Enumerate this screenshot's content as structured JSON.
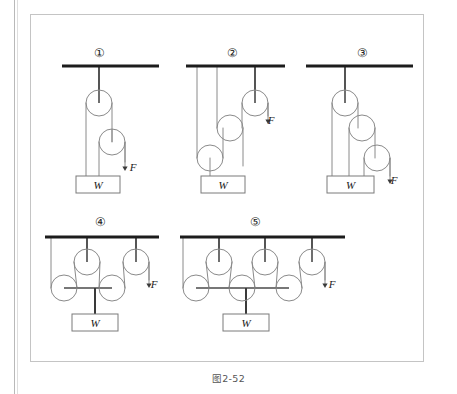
{
  "figure": {
    "caption": "图2-52",
    "background_color": "#ffffff",
    "border_color": "#c4c4c4",
    "line_color": "#6b6b6b",
    "ceiling_color": "#1c1c1c",
    "rope_color": "#8a8a8a",
    "pulley_stroke": "#8a8a8a",
    "text_color": "#222222"
  },
  "diagrams": [
    {
      "id": "diagram-1",
      "label": "①",
      "label_x": 99,
      "label_y": 57,
      "ceiling": {
        "x1": 62,
        "y1": 66,
        "x2": 159,
        "y2": 66
      },
      "effort_label": "F",
      "effort_label_x": 133,
      "effort_label_y": 171,
      "load_label": "W",
      "load_box": {
        "x": 76,
        "y": 176,
        "w": 44,
        "h": 17
      },
      "pulleys": [
        {
          "name": "fixed-pulley-1",
          "cx": 99,
          "cy": 103,
          "r": 13,
          "type": "fixed"
        },
        {
          "name": "movable-pulley-1",
          "cx": 112,
          "cy": 142,
          "r": 13,
          "type": "movable"
        }
      ]
    },
    {
      "id": "diagram-2",
      "label": "②",
      "label_x": 232,
      "label_y": 57,
      "ceiling": {
        "x1": 186,
        "y1": 66,
        "x2": 285,
        "y2": 66
      },
      "effort_label": "F",
      "effort_label_x": 271,
      "effort_label_y": 124,
      "load_label": "W",
      "load_box": {
        "x": 201,
        "y": 176,
        "w": 44,
        "h": 17
      },
      "pulleys": [
        {
          "name": "fixed-pulley-1",
          "cx": 255,
          "cy": 103,
          "r": 13,
          "type": "fixed"
        },
        {
          "name": "movable-pulley-1",
          "cx": 230,
          "cy": 128,
          "r": 13,
          "type": "movable"
        },
        {
          "name": "movable-pulley-2",
          "cx": 210,
          "cy": 158,
          "r": 13,
          "type": "movable"
        }
      ]
    },
    {
      "id": "diagram-3",
      "label": "③",
      "label_x": 362,
      "label_y": 57,
      "ceiling": {
        "x1": 306,
        "y1": 66,
        "x2": 413,
        "y2": 66
      },
      "effort_label": "F",
      "effort_label_x": 394,
      "effort_label_y": 184,
      "load_label": "W",
      "load_box": {
        "x": 327,
        "y": 176,
        "w": 47,
        "h": 17
      },
      "pulleys": [
        {
          "name": "fixed-pulley-1",
          "cx": 345,
          "cy": 103,
          "r": 13,
          "type": "fixed"
        },
        {
          "name": "movable-pulley-1",
          "cx": 362,
          "cy": 128,
          "r": 13,
          "type": "movable"
        },
        {
          "name": "movable-pulley-2",
          "cx": 377,
          "cy": 158,
          "r": 13,
          "type": "movable"
        }
      ]
    },
    {
      "id": "diagram-4",
      "label": "④",
      "label_x": 100,
      "label_y": 226,
      "ceiling": {
        "x1": 45,
        "y1": 237,
        "x2": 159,
        "y2": 237
      },
      "effort_label": "F",
      "effort_label_x": 154,
      "effort_label_y": 288,
      "load_label": "W",
      "load_box": {
        "x": 72,
        "y": 314,
        "w": 46,
        "h": 17
      },
      "pulleys": [
        {
          "name": "fixed-pulley-1",
          "cx": 87,
          "cy": 262,
          "r": 13,
          "type": "fixed"
        },
        {
          "name": "fixed-pulley-2",
          "cx": 136,
          "cy": 262,
          "r": 13,
          "type": "fixed"
        },
        {
          "name": "movable-pulley-1",
          "cx": 64,
          "cy": 288,
          "r": 13,
          "type": "movable"
        },
        {
          "name": "movable-pulley-2",
          "cx": 112,
          "cy": 288,
          "r": 13,
          "type": "movable"
        }
      ]
    },
    {
      "id": "diagram-5",
      "label": "⑤",
      "label_x": 255,
      "label_y": 226,
      "ceiling": {
        "x1": 180,
        "y1": 237,
        "x2": 345,
        "y2": 237
      },
      "effort_label": "F",
      "effort_label_x": 332,
      "effort_label_y": 288,
      "load_label": "W",
      "load_box": {
        "x": 223,
        "y": 314,
        "w": 46,
        "h": 17
      },
      "pulleys": [
        {
          "name": "fixed-pulley-1",
          "cx": 219,
          "cy": 262,
          "r": 13,
          "type": "fixed"
        },
        {
          "name": "fixed-pulley-2",
          "cx": 265,
          "cy": 262,
          "r": 13,
          "type": "fixed"
        },
        {
          "name": "fixed-pulley-3",
          "cx": 312,
          "cy": 262,
          "r": 13,
          "type": "fixed"
        },
        {
          "name": "movable-pulley-1",
          "cx": 196,
          "cy": 288,
          "r": 13,
          "type": "movable"
        },
        {
          "name": "movable-pulley-2",
          "cx": 242,
          "cy": 288,
          "r": 13,
          "type": "movable"
        },
        {
          "name": "movable-pulley-3",
          "cx": 289,
          "cy": 288,
          "r": 13,
          "type": "movable"
        }
      ]
    }
  ]
}
